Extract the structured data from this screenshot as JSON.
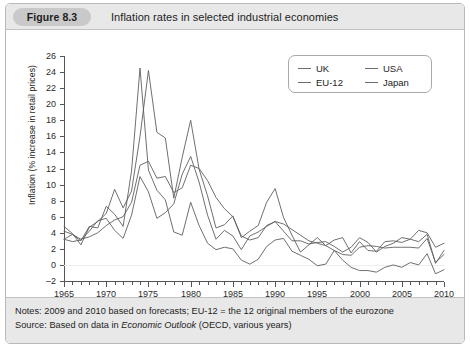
{
  "figure": {
    "badge": "Figure 8.3",
    "title": "Inflation rates in selected industrial economies"
  },
  "footer": {
    "notes_label": "Notes:",
    "notes_text": " 2009 and 2010 based on forecasts; EU-12 = the 12 original members of the eurozone",
    "source_label": "Source:",
    "source_pre": " Based on data in ",
    "source_em": "Economic Outlook",
    "source_post": " (OECD, various years)"
  },
  "legend": {
    "uk": "UK",
    "usa": "USA",
    "eu12": "EU-12",
    "japan": "Japan"
  },
  "chart_data": {
    "type": "line",
    "title": "Inflation rates in selected industrial economies",
    "xlabel": "",
    "ylabel": "Inflation (% increase in retail prices)",
    "xlim": [
      1965,
      2010
    ],
    "ylim": [
      -2,
      26
    ],
    "ytick_step": 2,
    "yticks": [
      26,
      24,
      22,
      20,
      18,
      16,
      14,
      12,
      10,
      8,
      6,
      4,
      2,
      0,
      -2
    ],
    "xticks": [
      1965,
      1970,
      1975,
      1980,
      1985,
      1990,
      1995,
      2000,
      2005,
      2010
    ],
    "xtick_minor_step": 1,
    "grid": "zero-line-only",
    "legend_position": "top-right-inside",
    "line_color": "#5f5f5f",
    "x": [
      1965,
      1966,
      1967,
      1968,
      1969,
      1970,
      1971,
      1972,
      1973,
      1974,
      1975,
      1976,
      1977,
      1978,
      1979,
      1980,
      1981,
      1982,
      1983,
      1984,
      1985,
      1986,
      1987,
      1988,
      1989,
      1990,
      1991,
      1992,
      1993,
      1994,
      1995,
      1996,
      1997,
      1998,
      1999,
      2000,
      2001,
      2002,
      2003,
      2004,
      2005,
      2006,
      2007,
      2008,
      2009,
      2010
    ],
    "series": [
      {
        "name": "UK",
        "values": [
          4.8,
          3.9,
          2.5,
          4.7,
          5.4,
          6.4,
          9.4,
          7.1,
          9.2,
          16.0,
          24.2,
          16.5,
          15.8,
          8.3,
          13.4,
          18.0,
          11.9,
          8.6,
          4.6,
          5.0,
          6.1,
          3.4,
          4.2,
          4.9,
          7.8,
          9.5,
          5.9,
          3.7,
          1.6,
          2.5,
          3.4,
          2.4,
          3.1,
          3.4,
          1.5,
          2.9,
          1.8,
          1.7,
          2.9,
          3.0,
          2.8,
          3.2,
          4.3,
          4.0,
          2.2,
          2.7
        ]
      },
      {
        "name": "USA",
        "values": [
          3.2,
          2.9,
          3.1,
          4.2,
          5.5,
          5.8,
          4.3,
          3.3,
          6.2,
          11.0,
          9.1,
          5.8,
          6.5,
          7.6,
          11.3,
          13.5,
          10.3,
          6.2,
          3.2,
          4.3,
          3.6,
          1.9,
          3.6,
          4.1,
          4.8,
          5.4,
          4.2,
          3.0,
          3.0,
          2.6,
          2.8,
          2.9,
          2.3,
          1.6,
          2.2,
          3.4,
          2.8,
          1.6,
          2.3,
          2.7,
          3.4,
          3.2,
          2.9,
          3.8,
          0.2,
          1.8
        ]
      },
      {
        "name": "EU-12",
        "values": [
          4.2,
          3.8,
          3.2,
          3.5,
          4.0,
          4.9,
          5.6,
          6.0,
          7.8,
          12.4,
          12.9,
          10.8,
          11.0,
          9.0,
          9.6,
          12.4,
          12.0,
          10.5,
          8.4,
          7.0,
          6.0,
          3.6,
          3.1,
          3.4,
          4.9,
          5.4,
          5.1,
          4.4,
          3.7,
          3.0,
          2.7,
          2.4,
          1.8,
          1.3,
          1.2,
          2.2,
          2.4,
          2.3,
          2.1,
          2.2,
          2.2,
          2.2,
          2.1,
          3.3,
          0.3,
          1.3
        ]
      },
      {
        "name": "Japan",
        "values": [
          3.2,
          3.8,
          3.0,
          4.8,
          4.6,
          7.3,
          6.3,
          4.8,
          11.7,
          24.5,
          11.8,
          9.3,
          8.1,
          4.1,
          3.7,
          7.8,
          4.9,
          2.7,
          1.9,
          2.2,
          2.0,
          0.6,
          0.1,
          0.7,
          2.3,
          3.1,
          3.3,
          1.7,
          1.2,
          0.7,
          -0.1,
          0.1,
          1.8,
          0.6,
          -0.3,
          -0.7,
          -0.7,
          -0.9,
          -0.3,
          0.0,
          -0.3,
          0.3,
          0.0,
          1.4,
          -1.1,
          -0.6
        ]
      }
    ]
  }
}
